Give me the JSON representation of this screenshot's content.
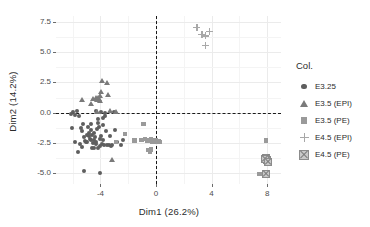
{
  "chart_data": {
    "type": "scatter",
    "title": "",
    "xlabel": "Dim1 (26.2%)",
    "ylabel": "Dim2 (14.2%)",
    "xlim": [
      -7.2,
      9.0
    ],
    "ylim": [
      -5.9,
      8.0
    ],
    "xticks": [
      "-4",
      "0",
      "4",
      "8"
    ],
    "xtick_values": [
      -4,
      0,
      4,
      8
    ],
    "yticks": [
      "7.5",
      "5.0",
      "2.5",
      "0.0",
      "-2.5",
      "-5.0"
    ],
    "ytick_values": [
      7.5,
      5.0,
      2.5,
      0.0,
      -2.5,
      -5.0
    ],
    "grid": true,
    "reference_lines": [
      {
        "axis": "x",
        "value": 0,
        "style": "dashed"
      },
      {
        "axis": "y",
        "value": 0,
        "style": "dashed"
      }
    ],
    "legend": {
      "title": "Col.",
      "position": "right",
      "entries": [
        {
          "label": "E3.25",
          "marker": "circle",
          "color": "#5e5e5e"
        },
        {
          "label": "E3.5 (EPI)",
          "marker": "triangle",
          "color": "#7a7a7a"
        },
        {
          "label": "E3.5 (PE)",
          "marker": "square",
          "color": "#9a9a9a"
        },
        {
          "label": "E4.5 (EPI)",
          "marker": "plus",
          "color": "#a8a8a8"
        },
        {
          "label": "E4.5 (PE)",
          "marker": "square-x",
          "color": "#8c8c8c"
        }
      ]
    },
    "series": [
      {
        "name": "E3.25",
        "marker": "circle",
        "color": "#5e5e5e",
        "points": [
          [
            -5.95,
            0.05
          ],
          [
            -5.8,
            -0.15
          ],
          [
            -5.7,
            0.1
          ],
          [
            -5.55,
            -0.3
          ],
          [
            -5.4,
            -1.25
          ],
          [
            -5.3,
            -1.55
          ],
          [
            -5.2,
            -2.05
          ],
          [
            -5.1,
            -2.35
          ],
          [
            -5.05,
            -2.45
          ],
          [
            -4.95,
            -2.4
          ],
          [
            -4.85,
            -1.7
          ],
          [
            -4.8,
            -1.95
          ],
          [
            -4.75,
            -2.15
          ],
          [
            -4.7,
            -2.3
          ],
          [
            -4.65,
            -1.45
          ],
          [
            -4.6,
            -1.85
          ],
          [
            -4.55,
            -2.5
          ],
          [
            -4.5,
            -2.25
          ],
          [
            -4.45,
            -1.65
          ],
          [
            -4.4,
            -2.05
          ],
          [
            -4.35,
            -2.4
          ],
          [
            -4.3,
            -2.6
          ],
          [
            -4.25,
            -1.35
          ],
          [
            -4.2,
            -0.55
          ],
          [
            -4.15,
            -0.85
          ],
          [
            -4.1,
            -1.15
          ],
          [
            -4.05,
            -2.75
          ],
          [
            -4.0,
            -2.2
          ],
          [
            -3.95,
            -1.95
          ],
          [
            -3.9,
            -2.55
          ],
          [
            -3.85,
            -0.45
          ],
          [
            -3.8,
            -1.05
          ],
          [
            -3.75,
            -2.7
          ],
          [
            -3.7,
            0.0
          ],
          [
            -3.65,
            -0.25
          ],
          [
            -3.6,
            -1.55
          ],
          [
            -3.5,
            -2.65
          ],
          [
            -3.4,
            -2.7
          ],
          [
            -3.25,
            -2.75
          ],
          [
            -3.15,
            -2.7
          ],
          [
            -3.05,
            0.05
          ],
          [
            -2.95,
            -1.45
          ],
          [
            -2.8,
            -2.4
          ],
          [
            -2.55,
            -2.65
          ],
          [
            -5.6,
            -3.25
          ],
          [
            -5.15,
            -4.85
          ],
          [
            -4.05,
            -5.0
          ],
          [
            -6.05,
            -1.3
          ],
          [
            -6.15,
            -0.1
          ],
          [
            -5.85,
            -2.45
          ],
          [
            -5.45,
            -2.55
          ],
          [
            -5.25,
            -0.95
          ],
          [
            -4.9,
            -1.15
          ],
          [
            -4.35,
            0.1
          ],
          [
            -3.95,
            0.05
          ],
          [
            -3.3,
            -1.95
          ],
          [
            -2.4,
            -2.3
          ],
          [
            -4.6,
            -2.95
          ],
          [
            -4.45,
            -2.9
          ],
          [
            -5.0,
            -1.85
          ],
          [
            -4.7,
            -0.95
          ],
          [
            -4.2,
            -2.9
          ],
          [
            -3.85,
            -2.3
          ],
          [
            -5.35,
            -2.85
          ]
        ]
      },
      {
        "name": "E3.5 (EPI)",
        "marker": "triangle",
        "color": "#7a7a7a",
        "points": [
          [
            -5.35,
            1.05
          ],
          [
            -4.7,
            0.75
          ],
          [
            -4.55,
            1.15
          ],
          [
            -4.35,
            1.2
          ],
          [
            -4.25,
            1.05
          ],
          [
            -4.15,
            1.25
          ],
          [
            -4.1,
            1.1
          ],
          [
            -4.05,
            0.95
          ],
          [
            -3.95,
            1.7
          ],
          [
            -3.9,
            2.6
          ],
          [
            -3.55,
            2.45
          ],
          [
            -3.45,
            1.45
          ],
          [
            -3.3,
            0.15
          ],
          [
            -2.85,
            0.05
          ],
          [
            -3.2,
            -3.95
          ],
          [
            -4.25,
            0.05
          ],
          [
            -4.0,
            1.35
          ]
        ]
      },
      {
        "name": "E3.5 (PE)",
        "marker": "square",
        "color": "#9a9a9a",
        "points": [
          [
            -2.9,
            -2.45
          ],
          [
            -2.25,
            -1.75
          ],
          [
            -1.55,
            -2.3
          ],
          [
            -1.05,
            -2.25
          ],
          [
            -0.8,
            -2.2
          ],
          [
            -0.6,
            -2.35
          ],
          [
            -0.5,
            -2.25
          ],
          [
            -0.45,
            -2.3
          ],
          [
            -0.35,
            -2.2
          ],
          [
            -0.3,
            -2.4
          ],
          [
            -0.25,
            -2.3
          ],
          [
            -0.2,
            -2.35
          ],
          [
            -0.15,
            -2.25
          ],
          [
            -0.1,
            -2.45
          ],
          [
            0.0,
            -2.3
          ],
          [
            0.1,
            -2.4
          ],
          [
            0.2,
            -2.35
          ],
          [
            0.3,
            -2.45
          ],
          [
            -0.9,
            -0.95
          ],
          [
            -0.55,
            -3.1
          ],
          [
            -0.45,
            -3.2
          ],
          [
            -0.35,
            -3.05
          ],
          [
            7.9,
            -2.3
          ],
          [
            7.45,
            -5.05
          ]
        ]
      },
      {
        "name": "E4.5 (EPI)",
        "marker": "plus",
        "color": "#a8a8a8",
        "points": [
          [
            2.95,
            7.05
          ],
          [
            3.3,
            6.5
          ],
          [
            3.55,
            6.35
          ],
          [
            3.85,
            6.7
          ],
          [
            3.55,
            5.55
          ]
        ]
      },
      {
        "name": "E4.5 (PE)",
        "marker": "square-x",
        "color": "#8c8c8c",
        "points": [
          [
            7.95,
            -3.75
          ],
          [
            8.0,
            -3.95
          ],
          [
            7.85,
            -3.85
          ],
          [
            8.05,
            -4.05
          ],
          [
            7.95,
            -5.1
          ]
        ]
      }
    ]
  }
}
